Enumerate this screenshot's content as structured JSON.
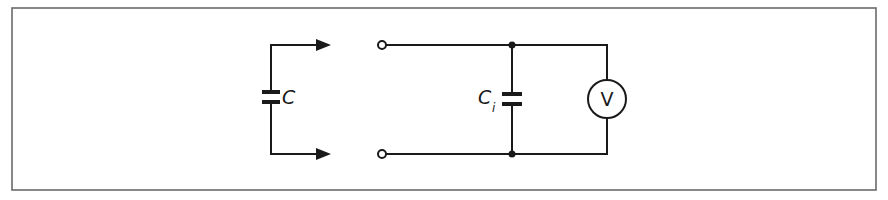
{
  "diagram": {
    "type": "circuit-schematic",
    "frame": {
      "x": 12,
      "y": 8,
      "width": 864,
      "height": 182,
      "stroke": "#6a6a6a"
    },
    "colors": {
      "ink": "#1a1a1a",
      "background": "#ffffff"
    },
    "components": [
      {
        "id": "capacitor-c",
        "kind": "capacitor",
        "label": "C",
        "subscript": ""
      },
      {
        "id": "capacitor-ci",
        "kind": "capacitor",
        "label": "C",
        "subscript": "i"
      },
      {
        "id": "voltmeter",
        "kind": "voltmeter",
        "label": "V"
      }
    ],
    "terminals": [
      {
        "id": "terminal-top",
        "kind": "open-terminal"
      },
      {
        "id": "terminal-bottom",
        "kind": "open-terminal"
      }
    ],
    "junctions": [
      {
        "id": "junction-top"
      },
      {
        "id": "junction-bottom"
      }
    ],
    "arrows": [
      {
        "id": "arrow-top",
        "direction": "right"
      },
      {
        "id": "arrow-bottom",
        "direction": "right"
      }
    ]
  }
}
